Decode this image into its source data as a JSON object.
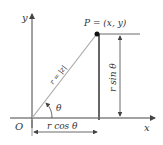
{
  "diagram": {
    "labels": {
      "y_axis": "y",
      "x_axis": "x",
      "origin": "O",
      "point": "P = (x, y)",
      "radius": "r = |z|",
      "angle": "θ",
      "horizontal": "r cos θ",
      "vertical": "r sin θ"
    },
    "colors": {
      "axis": "#444444",
      "radius_line": "#aaaaaa",
      "vertical_line": "#666666",
      "text": "#333333"
    }
  }
}
